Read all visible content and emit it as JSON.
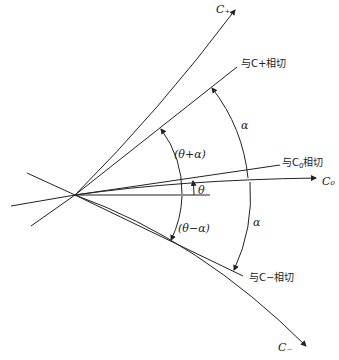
{
  "diagram": {
    "type": "characteristic-lines",
    "curves": {
      "c_plus": "C₊",
      "c_zero": "C₀",
      "c_minus": "C₋"
    },
    "tangents": {
      "c_plus_tangent": "与C+相切",
      "c_zero_tangent_prefix": "与C",
      "c_zero_tangent_sub": "0",
      "c_zero_tangent_suffix": "相切",
      "c_minus_tangent": "与C−相切"
    },
    "angles": {
      "theta_plus_alpha": "(θ+α)",
      "theta_minus_alpha": "(θ−α)",
      "theta": "θ",
      "alpha_upper": "α",
      "alpha_lower": "α"
    }
  }
}
